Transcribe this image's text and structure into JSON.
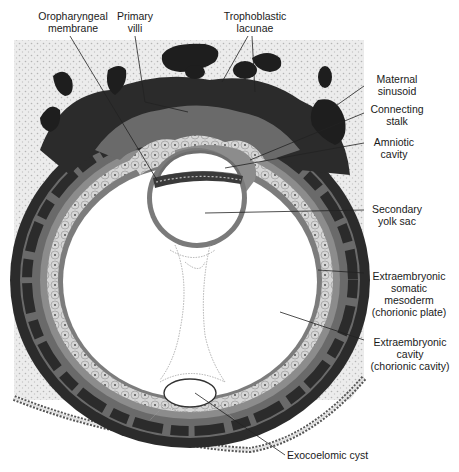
{
  "figure": {
    "colors": {
      "background": "#ffffff",
      "endometrium_stipple": "#e6e6e6",
      "syncytiotrophoblast": "#2a2a2a",
      "cytotrophoblast": "#6e6e6e",
      "mesoderm": "#8a8a8a",
      "cell_layer": "#d2d2d2",
      "lacuna": "#1c1c1c",
      "leader_line": "#222222"
    }
  },
  "labels": {
    "oropharyngeal_membrane": [
      "Oropharyngeal",
      "membrane"
    ],
    "primary_villi": [
      "Primary",
      "villi"
    ],
    "trophoblastic_lacunae": [
      "Trophoblastic",
      "lacunae"
    ],
    "maternal_sinusoid": [
      "Maternal",
      "sinusoid"
    ],
    "connecting_stalk": [
      "Connecting",
      "stalk"
    ],
    "amniotic_cavity": [
      "Amniotic",
      "cavity"
    ],
    "secondary_yolk_sac": [
      "Secondary",
      "yolk sac"
    ],
    "extraembryonic_somatic_mesoderm": [
      "Extraembryonic",
      "somatic",
      "mesoderm",
      "(chorionic plate)"
    ],
    "extraembryonic_cavity": [
      "Extraembryonic",
      "cavity",
      "(chorionic cavity)"
    ],
    "exocoelomic_cyst": [
      "Exocoelomic cyst"
    ]
  }
}
